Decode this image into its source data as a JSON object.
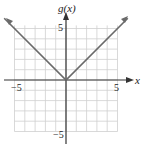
{
  "chart_data": {
    "type": "line",
    "title": "g(x)",
    "xlabel": "x",
    "ylabel": "g(x)",
    "xlim": [
      -5,
      5
    ],
    "ylim": [
      -5,
      5
    ],
    "grid": true,
    "x_tick_labels": [
      "-5",
      "5"
    ],
    "y_tick_labels": [
      "5",
      "-5"
    ],
    "series": [
      {
        "name": "g(x) = |x|",
        "x": [
          -6,
          0,
          6
        ],
        "y": [
          6,
          0,
          6
        ]
      }
    ]
  },
  "labels": {
    "y_axis": "g(x)",
    "x_axis": "x",
    "x_neg": "−5",
    "x_pos": "5",
    "y_pos": "5",
    "y_neg": "−5"
  },
  "colors": {
    "grid": "#c8c8c8",
    "axis": "#333333",
    "curve": "#666666"
  }
}
